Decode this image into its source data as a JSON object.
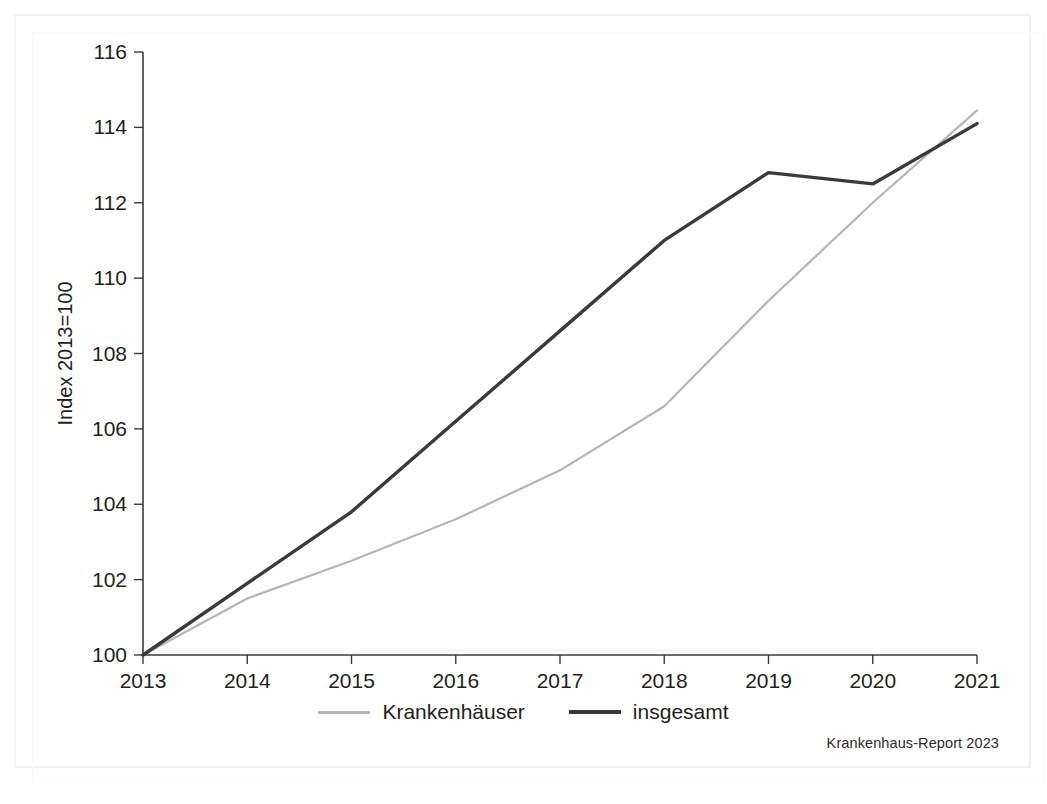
{
  "figure": {
    "source_note": "Krankenhaus-Report 2023",
    "frame_color": "#f2f2f2",
    "background": "#ffffff"
  },
  "legend": {
    "position": "bottom-center",
    "items": [
      {
        "label": "Krankenhäuser",
        "color": "#b5b5b5",
        "style": "solid-thin"
      },
      {
        "label": "insgesamt",
        "color": "#3a3a3a",
        "style": "solid-thick"
      }
    ]
  },
  "axes": {
    "y_title": "Index 2013=100",
    "y_ticks": [
      "100",
      "102",
      "104",
      "106",
      "108",
      "110",
      "112",
      "114",
      "116"
    ],
    "x_ticks": [
      "2013",
      "2014",
      "2015",
      "2016",
      "2017",
      "2018",
      "2019",
      "2020",
      "2021"
    ]
  },
  "chart_data": {
    "type": "line",
    "title": "",
    "subtitle": "",
    "xlabel": "",
    "ylabel": "Index 2013=100",
    "x": [
      2013,
      2014,
      2015,
      2016,
      2017,
      2018,
      2019,
      2020,
      2021
    ],
    "categories": [
      "2013",
      "2014",
      "2015",
      "2016",
      "2017",
      "2018",
      "2019",
      "2020",
      "2021"
    ],
    "xlim": [
      2013,
      2021
    ],
    "ylim": [
      100,
      116
    ],
    "ytick_step": 2,
    "grid": false,
    "legend_position": "bottom-center",
    "series": [
      {
        "name": "Krankenhäuser",
        "color": "#b5b5b5",
        "linewidth": 2.2,
        "values": [
          100,
          101.5,
          102.5,
          103.6,
          104.9,
          106.6,
          109.4,
          112.0,
          114.45
        ]
      },
      {
        "name": "insgesamt",
        "color": "#3a3a3a",
        "linewidth": 3.4,
        "values": [
          100,
          101.9,
          103.8,
          106.2,
          108.6,
          111.0,
          112.8,
          112.5,
          114.1
        ]
      }
    ],
    "annotations": [
      {
        "text": "Krankenhaus-Report 2023",
        "position": "bottom-right"
      }
    ]
  }
}
